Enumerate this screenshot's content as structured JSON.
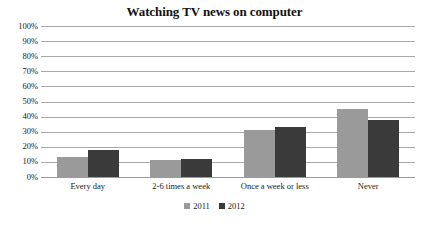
{
  "chart_data": {
    "type": "bar",
    "title": "Watching TV news on computer",
    "xlabel": "",
    "ylabel": "",
    "ylim": [
      0,
      100
    ],
    "ytick_labels": [
      "100%",
      "90%",
      "80%",
      "70%",
      "60%",
      "50%",
      "40%",
      "30%",
      "20%",
      "10%",
      "0%"
    ],
    "ytick_values": [
      100,
      90,
      80,
      70,
      60,
      50,
      40,
      30,
      20,
      10,
      0
    ],
    "grid": true,
    "legend_position": "bottom",
    "categories": [
      "Every day",
      "2-6 times a week",
      "Once a week or less",
      "Never"
    ],
    "series": [
      {
        "name": "2011",
        "color": "#9a9a9a",
        "values": [
          13,
          11,
          31,
          45
        ]
      },
      {
        "name": "2012",
        "color": "#3a3a3a",
        "values": [
          18,
          12,
          33,
          38
        ]
      }
    ]
  },
  "colors": {
    "series_2011": "#9a9a9a",
    "series_2012": "#3a3a3a",
    "gridline": "#a9a9a9",
    "text": "#1a1a1a",
    "background": "#ffffff"
  }
}
